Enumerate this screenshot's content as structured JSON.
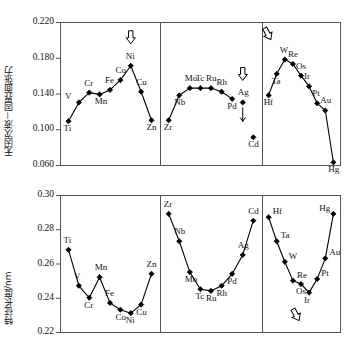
{
  "figure": {
    "background": "#ffffff",
    "line_color": "#000000",
    "marker_color": "#000000",
    "frame_color": "#555555"
  },
  "chart_data": [
    {
      "id": "top",
      "type": "line",
      "title": "",
      "xlabel": "",
      "ylabel": "无因次液－固界面张力",
      "ylim": [
        0.06,
        0.22
      ],
      "yticks": [
        "0.220",
        "0.180",
        "0.140",
        "0.100",
        "0.060"
      ],
      "ytick_values": [
        0.22,
        0.18,
        0.14,
        0.1,
        0.06
      ],
      "grid": false,
      "legend": "none",
      "panels": [
        {
          "name": "period-4",
          "categories": [
            "Ti",
            "V",
            "Cr",
            "Mn",
            "Fe",
            "Co",
            "Ni",
            "Cu",
            "Zn"
          ],
          "values": [
            0.109,
            0.13,
            0.141,
            0.139,
            0.144,
            0.155,
            0.171,
            0.142,
            0.11
          ],
          "label_positions": [
            "below",
            "left",
            "above",
            "below",
            "above",
            "above",
            "above",
            "above",
            "below"
          ],
          "annotation": {
            "icon": "down-arrow-outline",
            "at": "Ni"
          }
        },
        {
          "name": "period-5",
          "categories": [
            "Zr",
            "Nb",
            "Mo",
            "Tc",
            "Ru",
            "Rh",
            "Pd",
            "Ag",
            "Cd"
          ],
          "values": [
            0.11,
            0.138,
            0.146,
            0.146,
            0.146,
            0.142,
            0.134,
            0.13,
            0.091
          ],
          "label_positions": [
            "below",
            "below",
            "above",
            "above",
            "above",
            "above",
            "below",
            "above",
            "below"
          ],
          "annotation": {
            "icon": "down-arrow-outline",
            "at": "Ag"
          },
          "detached_point": "Ag"
        },
        {
          "name": "period-6",
          "categories": [
            "Hf",
            "Ta",
            "W",
            "Re",
            "Os",
            "Ir",
            "Pt",
            "Au",
            "Hg"
          ],
          "values": [
            0.138,
            0.162,
            0.178,
            0.173,
            0.16,
            0.148,
            0.129,
            0.121,
            0.063
          ],
          "label_positions": [
            "below",
            "below",
            "above",
            "above",
            "above",
            "above",
            "above",
            "above",
            "below"
          ],
          "annotation": {
            "icon": "up-arrow-outline",
            "at": "W"
          }
        }
      ]
    },
    {
      "id": "bottom",
      "type": "line",
      "title": "",
      "xlabel": "",
      "ylabel": "特征长度/nm",
      "ylim": [
        0.22,
        0.3
      ],
      "yticks": [
        "0.30",
        "0.28",
        "0.26",
        "0.24",
        "0.22"
      ],
      "ytick_values": [
        0.3,
        0.28,
        0.26,
        0.24,
        0.22
      ],
      "grid": false,
      "legend": "none",
      "panels": [
        {
          "name": "period-4",
          "categories": [
            "Ti",
            "V",
            "Cr",
            "Mn",
            "Fe",
            "Co",
            "Ni",
            "Cu",
            "Zn"
          ],
          "values": [
            0.268,
            0.247,
            0.24,
            0.252,
            0.237,
            0.233,
            0.231,
            0.236,
            0.254
          ],
          "label_positions": [
            "above",
            "above",
            "below",
            "above",
            "above",
            "below",
            "below",
            "below",
            "above"
          ]
        },
        {
          "name": "period-5",
          "categories": [
            "Zr",
            "Nb",
            "Mo",
            "Tc",
            "Ru",
            "Rh",
            "Pd",
            "Ag",
            "Cd"
          ],
          "values": [
            0.289,
            0.273,
            0.255,
            0.245,
            0.244,
            0.247,
            0.254,
            0.265,
            0.285
          ],
          "label_positions": [
            "above",
            "above",
            "below",
            "below",
            "below",
            "below",
            "below",
            "above",
            "above"
          ]
        },
        {
          "name": "period-6",
          "categories": [
            "Hf",
            "Ta",
            "W",
            "Re",
            "Os",
            "Ir",
            "Pt",
            "Au",
            "Hg"
          ],
          "values": [
            0.287,
            0.273,
            0.261,
            0.25,
            0.248,
            0.243,
            0.251,
            0.263,
            0.289
          ],
          "label_positions": [
            "right",
            "right",
            "right",
            "right",
            "below",
            "below",
            "right",
            "right",
            "left"
          ],
          "annotation": {
            "icon": "up-arrow-outline",
            "at": "Ir"
          }
        }
      ]
    }
  ]
}
